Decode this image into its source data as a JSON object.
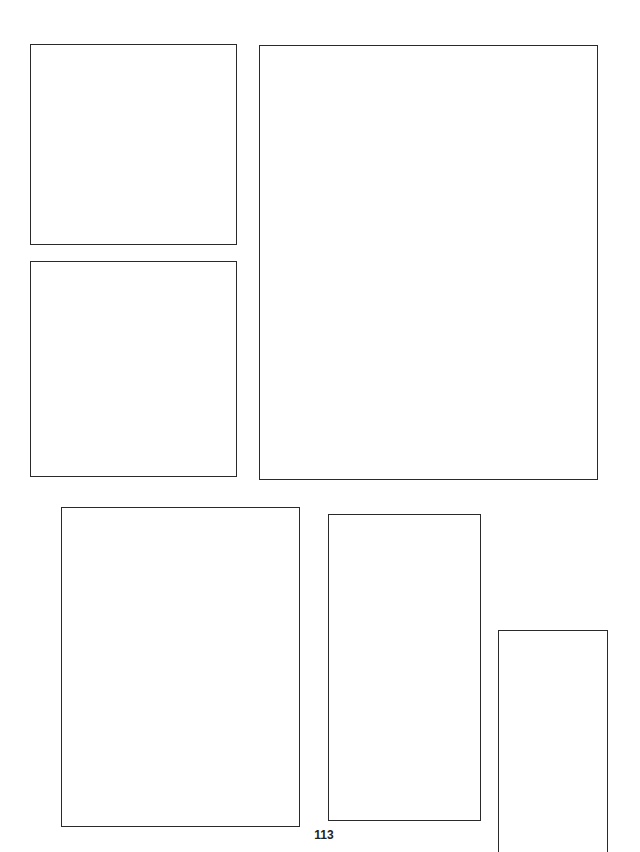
{
  "page": {
    "number": "113",
    "background": "#ffffff",
    "border_color": "#2a2a2a"
  },
  "panels": [
    {
      "id": 1,
      "left": 30,
      "top": 44,
      "width": 207,
      "height": 201,
      "open_bottom": false
    },
    {
      "id": 2,
      "left": 30,
      "top": 261,
      "width": 207,
      "height": 216,
      "open_bottom": false
    },
    {
      "id": 3,
      "left": 259,
      "top": 45,
      "width": 339,
      "height": 435,
      "open_bottom": false
    },
    {
      "id": 4,
      "left": 61,
      "top": 507,
      "width": 239,
      "height": 320,
      "open_bottom": false
    },
    {
      "id": 5,
      "left": 328,
      "top": 514,
      "width": 153,
      "height": 307,
      "open_bottom": false
    },
    {
      "id": 6,
      "left": 498,
      "top": 630,
      "width": 110,
      "height": 222,
      "open_bottom": true
    }
  ]
}
